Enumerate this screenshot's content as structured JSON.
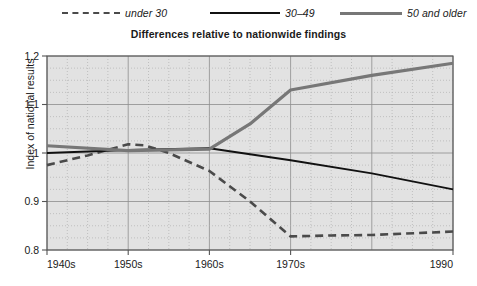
{
  "chart_data": {
    "type": "line",
    "title": "Differences relative to nationwide findings",
    "xlabel": "",
    "ylabel": "Index of national results",
    "ylim": [
      0.8,
      1.2
    ],
    "yticks": [
      "0.8",
      "0.9",
      "1",
      "1.1",
      "1.2"
    ],
    "ytick_values": [
      0.8,
      0.9,
      1.0,
      1.1,
      1.2
    ],
    "xlim": [
      1940,
      1990
    ],
    "categories": [
      "1940s",
      "1950s",
      "1960s",
      "1970s",
      "1990"
    ],
    "xtick_values": [
      1940,
      1950,
      1960,
      1970,
      1990
    ],
    "grid": true,
    "legend_position": "top",
    "series": [
      {
        "name": "under 30",
        "style": "dashed",
        "color": "#4a4a4a",
        "x": [
          1940,
          1945,
          1950,
          1952,
          1955,
          1960,
          1965,
          1970,
          1975,
          1980,
          1990
        ],
        "values": [
          0.975,
          0.995,
          1.018,
          1.016,
          1.0,
          0.963,
          0.9,
          0.828,
          0.83,
          0.831,
          0.838
        ]
      },
      {
        "name": "30–49",
        "style": "solid-thin",
        "color": "#111111",
        "x": [
          1940,
          1950,
          1960,
          1970,
          1980,
          1990
        ],
        "values": [
          1.0,
          1.006,
          1.01,
          0.985,
          0.958,
          0.925
        ]
      },
      {
        "name": "50 and older",
        "style": "solid-thick",
        "color": "#777777",
        "x": [
          1940,
          1950,
          1960,
          1965,
          1970,
          1980,
          1990
        ],
        "values": [
          1.015,
          1.005,
          1.008,
          1.06,
          1.13,
          1.16,
          1.185
        ]
      }
    ]
  },
  "legend": {
    "items": [
      {
        "label": "under 30"
      },
      {
        "label": "30–49"
      },
      {
        "label": "50 and older"
      }
    ]
  },
  "axes": {
    "y_title": "Index of national results"
  },
  "colors": {
    "plot_background": "#e2e2e2",
    "grid_minor": "#b0b0b0",
    "grid_major": "#8d8d8d",
    "axis": "#555555",
    "under30": "#4a4a4a",
    "age3049": "#111111",
    "age50older": "#777777"
  }
}
